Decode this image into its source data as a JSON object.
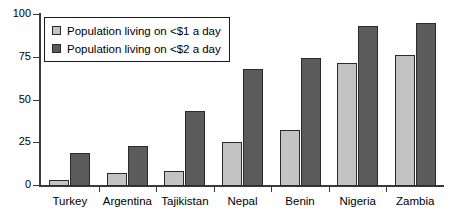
{
  "chart_data": {
    "type": "bar",
    "title": "",
    "subtitle": "",
    "xlabel": "",
    "ylabel": "",
    "ylim": [
      0,
      100
    ],
    "yticks": [
      0,
      25,
      50,
      75,
      100
    ],
    "ytick_labels": [
      "0",
      "25",
      "50",
      "75",
      "100"
    ],
    "grid": false,
    "legend_position": "top-left",
    "categories": [
      "Turkey",
      "Argentina",
      "Tajikistan",
      "Nepal",
      "Benin",
      "Nigeria",
      "Zambia"
    ],
    "series": [
      {
        "name": "Population living on <$1 a day",
        "color": "#c3c3c3",
        "values": [
          3,
          7,
          8,
          25,
          32,
          71.5,
          76
        ]
      },
      {
        "name": "Population living on <$2 a day",
        "color": "#5b5b5b",
        "values": [
          19,
          23,
          43,
          68,
          74,
          93,
          95
        ]
      }
    ]
  },
  "legend": {
    "items": [
      {
        "label": "Population living on <$1 a day",
        "swatch": "legend-swatch-series-1"
      },
      {
        "label": "Population living on <$2 a day",
        "swatch": "legend-swatch-series-2"
      }
    ]
  },
  "colors": {
    "series_1": "#c3c3c3",
    "series_2": "#5b5b5b",
    "axis": "#3a3a3a",
    "bar_outline": "#2b2b2b",
    "background": "#ffffff"
  }
}
